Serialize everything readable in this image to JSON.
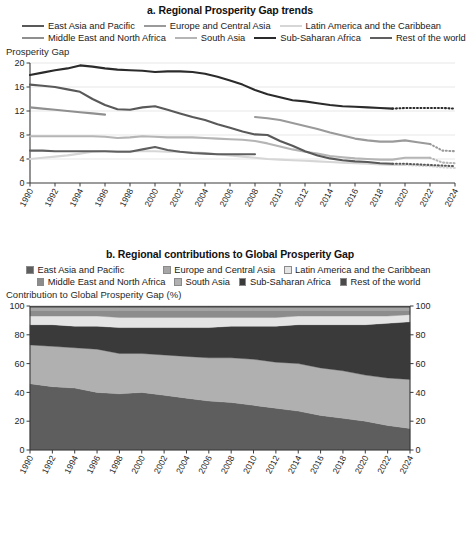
{
  "panel_a": {
    "title": "a. Regional Prosperity Gap trends",
    "ylabel": "Prosperity Gap",
    "legend": [
      {
        "label": "East Asia and Pacific",
        "color": "#595959"
      },
      {
        "label": "Europe and Central Asia",
        "color": "#9a9a9a"
      },
      {
        "label": "Latin America and the Caribbean",
        "color": "#d6d6d6"
      },
      {
        "label": "Middle East and North Africa",
        "color": "#8f8f8f"
      },
      {
        "label": "South Asia",
        "color": "#b5b5b5"
      },
      {
        "label": "Sub-Saharan Africa",
        "color": "#2b2b2b"
      },
      {
        "label": "Rest of the world",
        "color": "#5f5f5f"
      }
    ],
    "yticks": [
      "0",
      "4",
      "8",
      "12",
      "16",
      "20"
    ],
    "xticks": [
      "1990",
      "1992",
      "1994",
      "1996",
      "1998",
      "2000",
      "2002",
      "2004",
      "2006",
      "2008",
      "2010",
      "2012",
      "2014",
      "2016",
      "2018",
      "2020",
      "2022",
      "2024"
    ]
  },
  "panel_b": {
    "title": "b. Regional contributions to Global Prosperity Gap",
    "ylabel": "Contribution to Global Prosperity Gap (%)",
    "legend": [
      {
        "label": "East Asia and Pacific",
        "color": "#5e5e5e"
      },
      {
        "label": "Europe and Central Asia",
        "color": "#a6a6a6"
      },
      {
        "label": "Latin America and the Caribbean",
        "color": "#e4e4e4"
      },
      {
        "label": "Middle East and North Africa",
        "color": "#8c8c8c"
      },
      {
        "label": "South Asia",
        "color": "#b0b0b0"
      },
      {
        "label": "Sub-Saharan Africa",
        "color": "#3a3a3a"
      },
      {
        "label": "Rest of the world",
        "color": "#4a4a4a"
      }
    ],
    "yticks": [
      "0",
      "20",
      "40",
      "60",
      "80",
      "100"
    ],
    "yticks_right": [
      "0",
      "20",
      "40",
      "60",
      "80",
      "100"
    ],
    "xticks": [
      "1990",
      "1992",
      "1994",
      "1996",
      "1998",
      "2000",
      "2002",
      "2004",
      "2006",
      "2008",
      "2010",
      "2012",
      "2014",
      "2016",
      "2018",
      "2020",
      "2022",
      "2024"
    ]
  },
  "footnote": "",
  "chart_data": [
    {
      "type": "line",
      "title": "a. Regional Prosperity Gap trends",
      "xlabel": "",
      "ylabel": "Prosperity Gap",
      "ylim": [
        0,
        20
      ],
      "xlim": [
        1990,
        2024
      ],
      "grid": true,
      "legend_position": "top",
      "x": [
        1990,
        1991,
        1992,
        1993,
        1994,
        1995,
        1996,
        1997,
        1998,
        1999,
        2000,
        2001,
        2002,
        2003,
        2004,
        2005,
        2006,
        2007,
        2008,
        2009,
        2010,
        2011,
        2012,
        2013,
        2014,
        2015,
        2016,
        2017,
        2018,
        2019,
        2020,
        2021,
        2022,
        2023,
        2024
      ],
      "series": [
        {
          "name": "Sub-Saharan Africa",
          "color": "#2b2b2b",
          "solid_through": 2019,
          "values": [
            18.0,
            18.4,
            18.8,
            19.1,
            19.6,
            19.4,
            19.1,
            18.9,
            18.8,
            18.7,
            18.5,
            18.6,
            18.6,
            18.5,
            18.2,
            17.7,
            17.1,
            16.4,
            15.5,
            14.8,
            14.3,
            13.8,
            13.6,
            13.3,
            13.0,
            12.8,
            12.7,
            12.6,
            12.5,
            12.4,
            12.5,
            12.5,
            12.5,
            12.5,
            12.4
          ]
        },
        {
          "name": "East Asia and Pacific",
          "color": "#595959",
          "solid_through": 2019,
          "values": [
            16.4,
            16.2,
            16.0,
            15.6,
            15.2,
            14.0,
            13.0,
            12.3,
            12.2,
            12.6,
            12.8,
            12.2,
            11.6,
            11.0,
            10.5,
            9.8,
            9.2,
            8.6,
            8.1,
            8.0,
            7.0,
            6.2,
            5.3,
            4.6,
            4.1,
            3.8,
            3.6,
            3.5,
            3.3,
            3.2,
            3.2,
            3.1,
            3.0,
            2.9,
            2.8
          ]
        },
        {
          "name": "Middle East and North Africa",
          "color": "#8f8f8f",
          "solid_through": 1996,
          "values": [
            12.6,
            12.4,
            12.2,
            12.0,
            11.8,
            11.6,
            11.4,
            null,
            null,
            null,
            null,
            null,
            null,
            null,
            null,
            null,
            null,
            null,
            null,
            null,
            null,
            null,
            null,
            null,
            null,
            null,
            null,
            null,
            null,
            null,
            null,
            null,
            null,
            null,
            null
          ]
        },
        {
          "name": "Europe and Central Asia",
          "color": "#9a9a9a",
          "solid_through": 2022,
          "values": [
            null,
            null,
            null,
            null,
            null,
            null,
            null,
            null,
            null,
            null,
            null,
            null,
            null,
            null,
            null,
            null,
            null,
            null,
            11.0,
            10.8,
            10.5,
            10.0,
            9.5,
            9.0,
            8.4,
            7.9,
            7.4,
            7.1,
            6.9,
            6.9,
            7.1,
            6.8,
            6.5,
            5.4,
            5.3
          ]
        },
        {
          "name": "South Asia",
          "color": "#b5b5b5",
          "solid_through": 2022,
          "values": [
            7.8,
            7.8,
            7.8,
            7.8,
            7.8,
            7.8,
            7.7,
            7.5,
            7.6,
            7.8,
            7.7,
            7.6,
            7.6,
            7.6,
            7.5,
            7.4,
            7.3,
            7.2,
            7.0,
            6.6,
            6.1,
            5.6,
            5.2,
            4.9,
            4.5,
            4.3,
            4.1,
            4.0,
            3.9,
            3.9,
            4.2,
            4.2,
            4.2,
            3.4,
            3.3
          ]
        },
        {
          "name": "Rest of the world",
          "color": "#5f5f5f",
          "solid_through": 2008,
          "values": [
            5.4,
            5.4,
            5.3,
            5.3,
            5.3,
            5.3,
            5.3,
            5.2,
            5.2,
            5.6,
            6.0,
            5.5,
            5.2,
            5.0,
            4.9,
            4.8,
            4.8,
            4.8,
            4.8,
            null,
            null,
            null,
            null,
            null,
            null,
            null,
            null,
            null,
            null,
            null,
            null,
            null,
            null,
            null,
            null
          ]
        },
        {
          "name": "Latin America and the Caribbean",
          "color": "#d6d6d6",
          "solid_through": 2020,
          "values": [
            4.0,
            4.2,
            4.4,
            4.6,
            4.9,
            5.2,
            5.3,
            5.3,
            5.3,
            5.3,
            5.3,
            5.2,
            5.2,
            5.1,
            5.0,
            4.8,
            4.6,
            4.4,
            4.2,
            4.0,
            3.9,
            3.8,
            3.7,
            3.6,
            3.5,
            3.4,
            3.3,
            3.2,
            3.1,
            3.0,
            3.0,
            2.9,
            2.8,
            2.6,
            2.5
          ]
        }
      ]
    },
    {
      "type": "area",
      "title": "b. Regional contributions to Global Prosperity Gap",
      "xlabel": "",
      "ylabel": "Contribution to Global Prosperity Gap (%)",
      "ylim": [
        0,
        100
      ],
      "xlim": [
        1990,
        2024
      ],
      "grid": false,
      "stacked": true,
      "legend_position": "top",
      "x": [
        1990,
        1992,
        1994,
        1996,
        1998,
        2000,
        2002,
        2004,
        2006,
        2008,
        2010,
        2012,
        2014,
        2016,
        2018,
        2020,
        2022,
        2024
      ],
      "series": [
        {
          "name": "East Asia and Pacific",
          "color": "#5e5e5e",
          "values": [
            46,
            44,
            43,
            40,
            39,
            40,
            38,
            36,
            34,
            33,
            31,
            29,
            27,
            24,
            22,
            20,
            17,
            15
          ]
        },
        {
          "name": "South Asia",
          "color": "#b0b0b0",
          "values": [
            27,
            28,
            28,
            30,
            28,
            27,
            28,
            29,
            30,
            31,
            32,
            32,
            33,
            33,
            33,
            32,
            33,
            34
          ]
        },
        {
          "name": "Sub-Saharan Africa",
          "color": "#3a3a3a",
          "values": [
            14,
            15,
            15,
            16,
            18,
            18,
            19,
            20,
            21,
            22,
            23,
            25,
            27,
            30,
            32,
            35,
            38,
            40
          ]
        },
        {
          "name": "Latin America and the Caribbean",
          "color": "#e4e4e4",
          "values": [
            6,
            6,
            7,
            7,
            7,
            7,
            7,
            7,
            7,
            6,
            6,
            6,
            6,
            6,
            6,
            6,
            5,
            5
          ]
        },
        {
          "name": "Middle East and North Africa",
          "color": "#8c8c8c",
          "values": [
            4,
            4,
            4,
            4,
            5,
            5,
            5,
            5,
            5,
            5,
            5,
            5,
            4,
            4,
            4,
            4,
            4,
            3
          ]
        },
        {
          "name": "Europe and Central Asia",
          "color": "#a6a6a6",
          "values": [
            2,
            2,
            2,
            2,
            2,
            2,
            2,
            2,
            2,
            2,
            2,
            2,
            2,
            2,
            2,
            2,
            2,
            2
          ]
        },
        {
          "name": "Rest of the world",
          "color": "#4a4a4a",
          "values": [
            1,
            1,
            1,
            1,
            1,
            1,
            1,
            1,
            1,
            1,
            1,
            1,
            1,
            1,
            1,
            1,
            1,
            1
          ]
        }
      ]
    }
  ]
}
